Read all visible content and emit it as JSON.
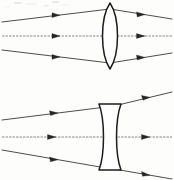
{
  "document": {
    "title": "Lens Ray Diagrams",
    "kind": "scanned-optics-figure",
    "background_color": "#fdfdfc",
    "ink_color": "#262626",
    "width": 174,
    "height": 180
  },
  "figures": [
    {
      "id": "converging",
      "name": "biconvex-converging-lens-diagram",
      "lens_type": "biconvex",
      "lens_label": "converging lens",
      "optical_axis_y": 36,
      "lens_center_x": 110,
      "lens_half_height": 33,
      "lens_half_width": 9,
      "rays": [
        {
          "name": "upper-ray",
          "label": "ray-1",
          "start": [
            2,
            22
          ],
          "lens_hit": [
            110,
            9
          ],
          "end": [
            172,
            19
          ],
          "arrow_in_t": 0.52,
          "arrow_out_t": 0.42
        },
        {
          "name": "axial-ray",
          "label": "ray-2",
          "start": [
            2,
            36
          ],
          "lens_hit": [
            110,
            36
          ],
          "end": [
            172,
            36
          ],
          "arrow_in_t": 0.52,
          "arrow_out_t": 0.45,
          "dashed": true
        },
        {
          "name": "lower-ray",
          "label": "ray-3",
          "start": [
            2,
            50
          ],
          "lens_hit": [
            110,
            63
          ],
          "end": [
            172,
            53
          ],
          "arrow_in_t": 0.52,
          "arrow_out_t": 0.42
        }
      ]
    },
    {
      "id": "diverging",
      "name": "biconcave-diverging-lens-diagram",
      "lens_type": "biconcave",
      "lens_label": "diverging lens",
      "optical_axis_y": 137,
      "lens_center_x": 110,
      "lens_half_height": 33,
      "lens_waist_half_width": 4,
      "lens_cap_half_width": 11,
      "rays": [
        {
          "name": "upper-ray",
          "label": "ray-1",
          "start": [
            2,
            120
          ],
          "lens_hit": [
            106,
            107
          ],
          "end": [
            172,
            92
          ],
          "arrow_in_t": 0.52,
          "arrow_out_t": 0.55
        },
        {
          "name": "axial-ray",
          "label": "ray-2",
          "start": [
            2,
            137
          ],
          "lens_hit": [
            106,
            137
          ],
          "end": [
            172,
            137
          ],
          "arrow_in_t": 0.5,
          "arrow_out_t": 0.55,
          "dashed": true
        },
        {
          "name": "lower-ray",
          "label": "ray-3",
          "start": [
            2,
            150
          ],
          "lens_hit": [
            106,
            168
          ],
          "end": [
            172,
            179
          ],
          "arrow_in_t": 0.52,
          "arrow_out_t": 0.55
        }
      ]
    }
  ]
}
